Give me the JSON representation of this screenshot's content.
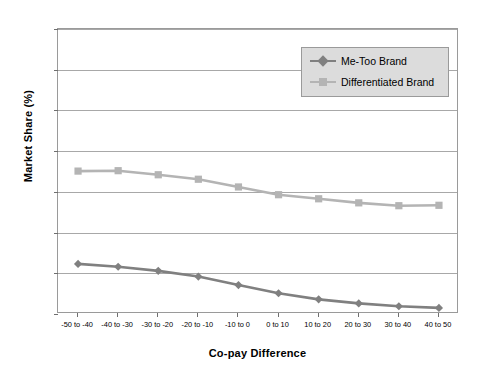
{
  "chart_data": {
    "type": "line",
    "title": "",
    "xlabel": "Co-pay Difference",
    "ylabel": "Market Share (%)",
    "categories": [
      "-50 to -40",
      "-40 to -30",
      "-30 to -20",
      "-20 to -10",
      "-10 to 0",
      "0 to 10",
      "10 to 20",
      "20 to 30",
      "30 to 40",
      "40 to 50"
    ],
    "series": [
      {
        "name": "Me-Too Brand",
        "color": "#808080",
        "marker": "diamond",
        "values": [
          12.3,
          11.6,
          10.6,
          9.2,
          7.1,
          5.1,
          3.6,
          2.6,
          1.9,
          1.5
        ]
      },
      {
        "name": "Differentiated Brand",
        "color": "#b4b4b4",
        "marker": "square",
        "values": [
          35.1,
          35.2,
          34.2,
          33.1,
          31.2,
          29.3,
          28.3,
          27.3,
          26.6,
          26.7
        ]
      }
    ],
    "ylim": [
      0,
      70
    ],
    "yticks": [
      0,
      10,
      20,
      30,
      40,
      50,
      60,
      70
    ],
    "grid": true,
    "legend_position": "top-right"
  },
  "legend": {
    "entries": [
      {
        "label": "Me-Too Brand"
      },
      {
        "label": "Differentiated Brand"
      }
    ]
  },
  "colors": {
    "me_too": "#808080",
    "differentiated": "#b4b4b4",
    "grid": "#a8a8a8",
    "axis": "#9a9a9a",
    "legend_background": "#dcdcdc"
  }
}
